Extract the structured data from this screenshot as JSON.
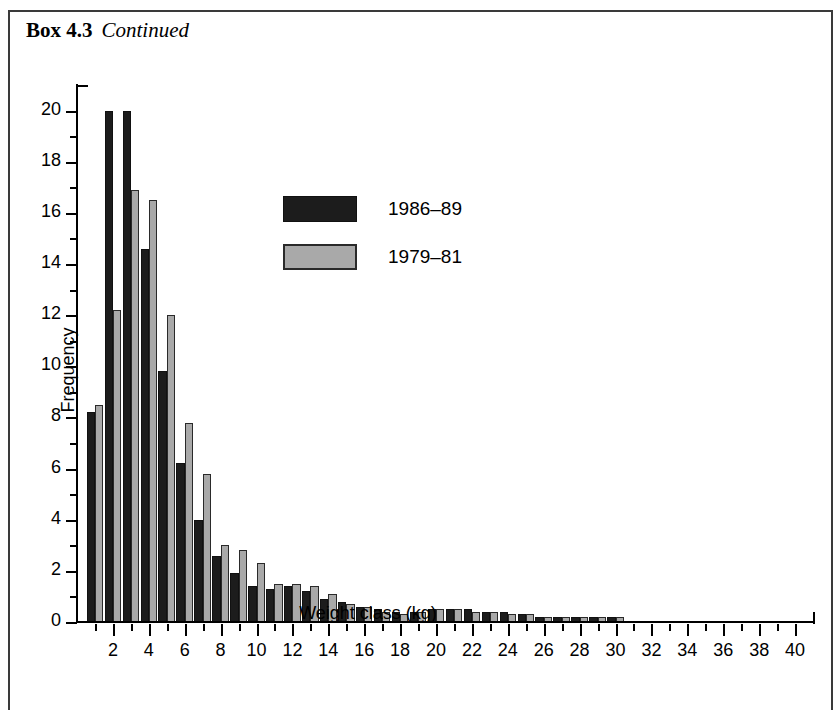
{
  "title": {
    "bold": "Box 4.3",
    "italic": "Continued"
  },
  "chart_data": {
    "type": "bar",
    "title": "",
    "xlabel": "Weight class (kg)",
    "ylabel": "Frequency",
    "xlim": [
      0,
      41
    ],
    "ylim": [
      0,
      21
    ],
    "grid": false,
    "legend_position": "inside-top-center",
    "x_major_ticks": [
      2,
      4,
      6,
      8,
      10,
      12,
      14,
      16,
      18,
      20,
      22,
      24,
      26,
      28,
      30,
      32,
      34,
      36,
      38,
      40
    ],
    "x_minor_ticks": [
      1,
      3,
      5,
      7,
      9,
      11,
      13,
      15,
      17,
      19,
      21,
      23,
      25,
      27,
      29,
      31,
      33,
      35,
      37,
      39
    ],
    "y_major_ticks": [
      0,
      2,
      4,
      6,
      8,
      10,
      12,
      14,
      16,
      18,
      20
    ],
    "y_minor_ticks": [
      1,
      3,
      5,
      7,
      9,
      11,
      13,
      15,
      17,
      19
    ],
    "categories": [
      1,
      2,
      3,
      4,
      5,
      6,
      7,
      8,
      9,
      10,
      11,
      12,
      13,
      14,
      15,
      16,
      17,
      18,
      19,
      20,
      21,
      22,
      23,
      24,
      25,
      26,
      27,
      28,
      29,
      30
    ],
    "series": [
      {
        "name": "1986-89",
        "color": "#1c1c1c",
        "values": [
          8.2,
          20.0,
          20.0,
          14.6,
          9.8,
          6.2,
          4.0,
          2.6,
          1.9,
          1.4,
          1.3,
          1.4,
          1.2,
          0.9,
          0.8,
          0.6,
          0.5,
          0.4,
          0.4,
          0.5,
          0.5,
          0.5,
          0.4,
          0.4,
          0.3,
          0.2,
          0.2,
          0.2,
          0.2,
          0.2
        ]
      },
      {
        "name": "1979-81",
        "color": "#a9a9a9",
        "values": [
          8.5,
          12.2,
          16.9,
          16.5,
          12.0,
          7.8,
          5.8,
          3.0,
          2.8,
          2.3,
          1.5,
          1.5,
          1.4,
          1.1,
          0.7,
          0.6,
          0.4,
          0.3,
          0.4,
          0.5,
          0.5,
          0.4,
          0.4,
          0.3,
          0.3,
          0.2,
          0.2,
          0.2,
          0.2,
          0.2
        ]
      }
    ]
  },
  "legend": {
    "entries": [
      {
        "label": "1986–89",
        "swatch": "dark"
      },
      {
        "label": "1979–81",
        "swatch": "light"
      }
    ]
  }
}
